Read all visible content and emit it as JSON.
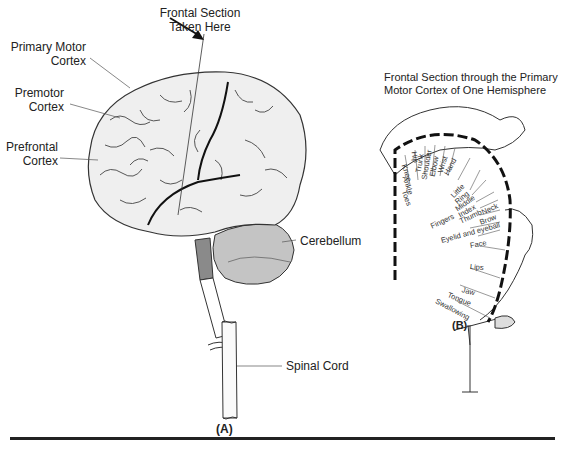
{
  "panel_a": {
    "label": "(A)",
    "labels": {
      "frontal_section_line1": "Frontal Section",
      "frontal_section_line2": "Taken Here",
      "primary_motor_line1": "Primary Motor",
      "primary_motor_line2": "Cortex",
      "premotor_line1": "Premotor",
      "premotor_line2": "Cortex",
      "prefrontal_line1": "Prefrontal",
      "prefrontal_line2": "Cortex",
      "cerebellum": "Cerebellum",
      "spinal_cord": "Spinal Cord"
    }
  },
  "panel_b": {
    "label": "(B)",
    "title_line1": "Frontal Section through the Primary",
    "title_line2": "Motor Cortex of One Hemisphere",
    "homunculus_labels": [
      "Toes",
      "Ankle",
      "Knee",
      "Hip",
      "Trunk",
      "Shoulder",
      "Elbow",
      "Wrist",
      "Hand",
      "Little",
      "Ring",
      "Middle",
      "Index",
      "Thumb",
      "Neck",
      "Brow",
      "Fingers",
      "Eyelid and eyeball",
      "Face",
      "Lips",
      "Jaw",
      "Tongue",
      "Swallowing"
    ]
  },
  "colors": {
    "brain_fill": "#efefef",
    "cerebellum_fill": "#c4c4c4",
    "brainstem_dark": "#8a8a8a",
    "line": "#222222"
  }
}
